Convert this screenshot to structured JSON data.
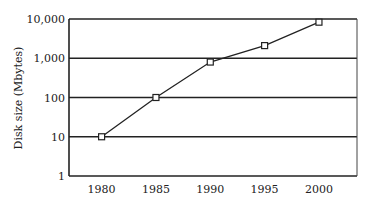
{
  "chart_data": {
    "type": "line",
    "title": "",
    "xlabel": "",
    "ylabel": "Disk size (Mbytes)",
    "yscale": "log",
    "ylim": [
      1,
      10000
    ],
    "grid": true,
    "legend": null,
    "x": [
      1980,
      1985,
      1990,
      1995,
      2000
    ],
    "x_tick_labels": [
      "1980",
      "1985",
      "1990",
      "1995",
      "2000"
    ],
    "y_tick_labels": [
      "1",
      "10",
      "100",
      "1,000",
      "10,000"
    ],
    "y_tick_values": [
      1,
      10,
      100,
      1000,
      10000
    ],
    "series": [
      {
        "name": "Disk size",
        "values": [
          10,
          100,
          800,
          2100,
          8300
        ],
        "marker": "square"
      }
    ]
  }
}
